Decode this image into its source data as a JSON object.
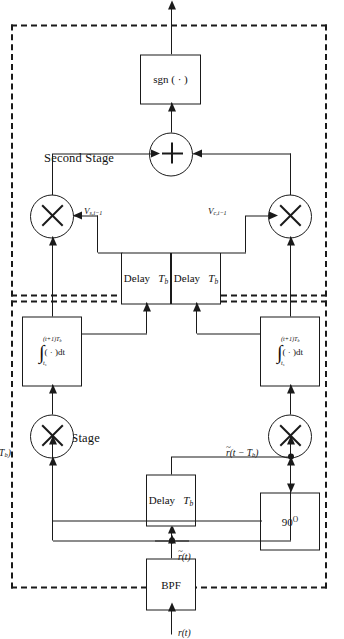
{
  "figure": {
    "type": "signal-processing block diagram",
    "orientation": "landscape content rotated 90 degrees within a portrait frame",
    "line_color": "#1a1a1a",
    "background_color": "#ffffff"
  },
  "stages": {
    "second": {
      "label": "Second Stage"
    },
    "first": {
      "label": "First Stage"
    }
  },
  "blocks": {
    "sgn": {
      "label": "sgn ( · )"
    },
    "bpf": {
      "label": "BPF"
    },
    "phase": {
      "label": "90",
      "unit": "O"
    },
    "delay_line": {
      "label": "Delay"
    },
    "delay_amt": {
      "label": "T",
      "sub": "b"
    },
    "integ_symbol": "∫",
    "integ_upper": "(t+1)T",
    "integ_upper_sub": "b",
    "integ_lower": "t",
    "integ_lower_sub": "s",
    "integ_body": "( · )dt"
  },
  "operators": {
    "mixer": "×",
    "adder": "+"
  },
  "signals": {
    "input": {
      "base": "r",
      "arg": "(t)"
    },
    "bpf_out": {
      "base": "r",
      "tilde": "~",
      "arg": "(t)"
    },
    "inphase_delay": {
      "base": "r",
      "tilde": "~",
      "arg": "(t − T",
      "sub": "b",
      "close": ")"
    },
    "quad_delay": {
      "base": "r",
      "tilde": "^",
      "sub90": "90",
      "arg": "(t − T",
      "sub": "b",
      "close": ")"
    },
    "v_c_i": {
      "base": "V",
      "sub": "c,i"
    },
    "v_c_i_1": {
      "base": "V",
      "sub": "c,i−1"
    },
    "v_s_i": {
      "base": "V",
      "sub": "s,i"
    },
    "v_s_i_1": {
      "base": "V",
      "sub": "s,i−1"
    }
  }
}
